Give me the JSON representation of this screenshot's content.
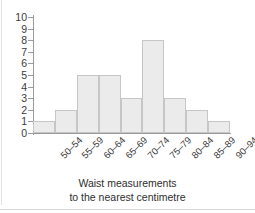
{
  "chart_data": {
    "type": "bar",
    "title": "",
    "subtitle": "",
    "xlabel": "Waist measurements to the nearest centimetre",
    "xlabel_lines": [
      "Waist measurements",
      "to the nearest centimetre"
    ],
    "ylabel": "",
    "categories": [
      "50–54",
      "55–59",
      "60–64",
      "65–69",
      "70–74",
      "75–79",
      "80–84",
      "85–89",
      "90–94"
    ],
    "values": [
      1,
      2,
      5,
      5,
      3,
      8,
      3,
      2,
      1
    ],
    "ylim": [
      0,
      10
    ],
    "ytick_labels": [
      "0",
      "1",
      "2",
      "3",
      "4",
      "5",
      "6",
      "7",
      "8",
      "9",
      "10"
    ],
    "ytick_values": [
      0,
      1,
      2,
      3,
      4,
      5,
      6,
      7,
      8,
      9,
      10
    ],
    "grid": false,
    "legend": null,
    "bar_fill_color": "#ebebeb",
    "bar_border_color": "#c6c6c6",
    "axis_color": "#9a9a9a",
    "text_color": "#3a3a3a",
    "background_color": "#ffffff"
  }
}
